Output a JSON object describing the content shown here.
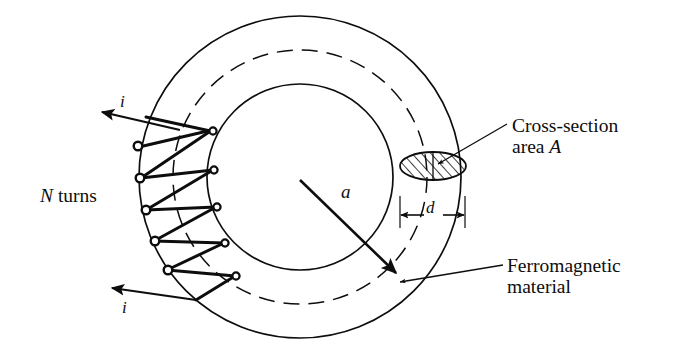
{
  "figure": {
    "background_color": "#ffffff",
    "line_color": "#0d0d0d"
  },
  "labels": {
    "n_turns_symbol": "N",
    "n_turns_text": " turns",
    "cross_section_line1": "Cross-section",
    "cross_section_line2_text": "area ",
    "cross_section_line2_symbol": "A",
    "ferromagnetic_line1": "Ferromagnetic",
    "ferromagnetic_line2": "material",
    "current_top": "i",
    "current_bottom": "i",
    "mean_radius": "a",
    "core_diameter": "d"
  },
  "geometry": {
    "center_x": 300,
    "center_y": 177,
    "outer_radius": 161,
    "mean_radius": 127,
    "inner_radius": 93,
    "cross_section_ellipse": {
      "cx": 433,
      "cy": 166,
      "rx": 33,
      "ry": 14,
      "hatched": true
    },
    "dimension_d": {
      "y": 215,
      "x_start": 401,
      "x_end": 464
    }
  },
  "icons": {
    "current_arrow_top": "arrow-icon",
    "current_arrow_bottom": "arrow-icon",
    "radius_arrow": "arrow-icon",
    "leader_cross_section": "leader-line-icon",
    "leader_ferromagnetic": "leader-arrow-icon",
    "dimension_arrows": "double-arrow-icon",
    "hatch_pattern": "hatch-icon"
  },
  "coil": {
    "turn_count_drawn": 6,
    "loop_marker": "circle",
    "description": "winding wrapped around left side of toroid"
  }
}
